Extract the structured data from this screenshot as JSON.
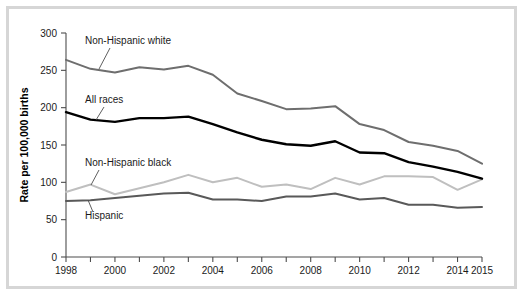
{
  "figure": {
    "border_color": "#d6d6d6",
    "background": "#ffffff"
  },
  "axes": {
    "y_title": "Rate per 100,000 births",
    "y_ticks": [
      "0",
      "50",
      "100",
      "150",
      "200",
      "250",
      "300"
    ],
    "x_ticks": [
      "1998",
      "2000",
      "2002",
      "2004",
      "2006",
      "2008",
      "2010",
      "2012",
      "2014",
      "2015"
    ]
  },
  "labels": {
    "non_hispanic_white": "Non-Hispanic white",
    "all_races": "All races",
    "non_hispanic_black": "Non-Hispanic black",
    "hispanic": "Hispanic"
  },
  "chart_data": {
    "type": "line",
    "title": "",
    "xlabel": "",
    "ylabel": "Rate per 100,000 births",
    "xlim": [
      1998,
      2015
    ],
    "ylim": [
      0,
      300
    ],
    "ytick_interval": 50,
    "grid": false,
    "legend": "inline-annotations",
    "x": [
      1998,
      1999,
      2000,
      2001,
      2002,
      2003,
      2004,
      2005,
      2006,
      2007,
      2008,
      2009,
      2010,
      2011,
      2012,
      2013,
      2014,
      2015
    ],
    "xtick_labels": [
      "1998",
      "2000",
      "2002",
      "2004",
      "2006",
      "2008",
      "2010",
      "2012",
      "2014",
      "2015"
    ],
    "series": [
      {
        "name": "Non-Hispanic white",
        "color": "#6e6e6e",
        "width": 2.0,
        "values": [
          264,
          252,
          247,
          254,
          251,
          256,
          244,
          219,
          209,
          198,
          199,
          202,
          178,
          170,
          154,
          149,
          142,
          125
        ]
      },
      {
        "name": "All races",
        "color": "#000000",
        "width": 2.4,
        "values": [
          194,
          184,
          181,
          186,
          186,
          188,
          178,
          167,
          157,
          151,
          149,
          155,
          140,
          139,
          127,
          121,
          114,
          105
        ]
      },
      {
        "name": "Non-Hispanic black",
        "color": "#bfbfbf",
        "width": 2.0,
        "values": [
          87,
          97,
          84,
          92,
          100,
          110,
          100,
          106,
          94,
          97,
          91,
          106,
          97,
          108,
          108,
          107,
          90,
          104
        ]
      },
      {
        "name": "Hispanic",
        "color": "#595959",
        "width": 2.0,
        "values": [
          75,
          76,
          79,
          82,
          85,
          86,
          77,
          77,
          75,
          81,
          81,
          85,
          77,
          79,
          70,
          70,
          66,
          67
        ]
      }
    ],
    "annotations": [
      {
        "text": "Non-Hispanic white",
        "points_to_year": 2000,
        "points_to_value": 251
      },
      {
        "text": "All races",
        "points_to_year": 2000,
        "points_to_value": 182
      },
      {
        "text": "Non-Hispanic black",
        "points_to_year": 1999,
        "points_to_value": 96
      },
      {
        "text": "Hispanic",
        "points_to_year": 1999,
        "points_to_value": 77
      }
    ]
  }
}
